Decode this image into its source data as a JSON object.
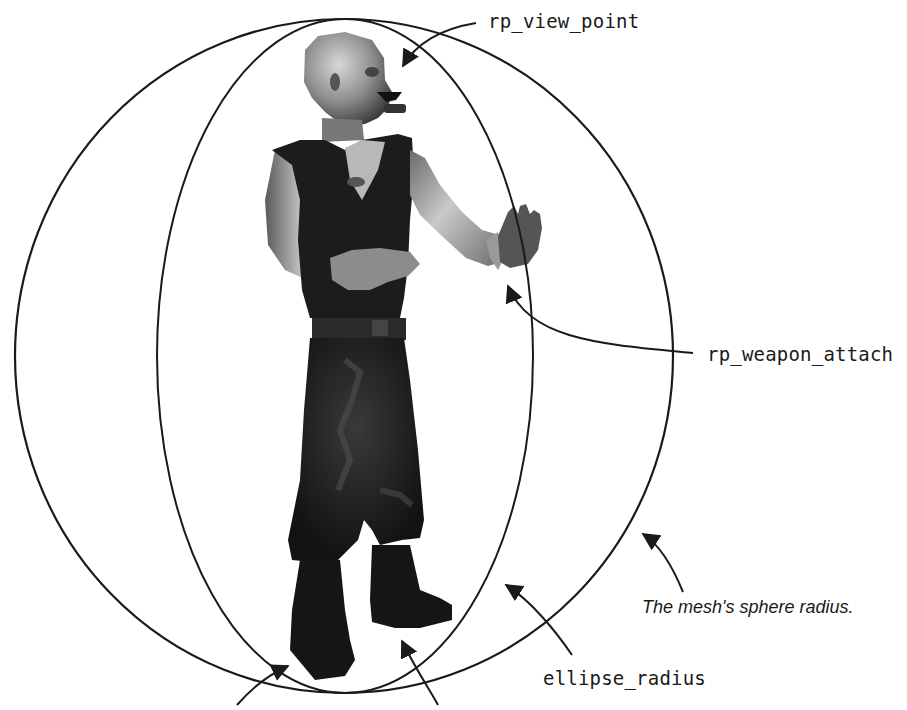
{
  "figure": {
    "labels": {
      "view_point": "rp_view_point",
      "weapon_attach": "rp_weapon_attach",
      "ellipse_radius": "ellipse_radius",
      "sphere_caption": "The mesh's sphere radius."
    },
    "colors": {
      "line": "#1a1a1a",
      "background": "#ffffff",
      "figure_dark": "#151515",
      "figure_skin": "#8a8a8a",
      "figure_skin_light": "#c8c8c8"
    },
    "geometry": {
      "outer_sphere": {
        "cx": 344,
        "cy": 356,
        "rx": 329,
        "ry": 337
      },
      "inner_ellipse": {
        "cx": 345,
        "cy": 356,
        "rx": 188,
        "ry": 337
      }
    }
  }
}
